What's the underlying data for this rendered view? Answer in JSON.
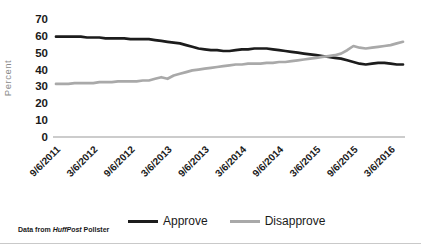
{
  "chart_data": {
    "type": "line",
    "title": "",
    "ylabel": "Percent",
    "ylim": [
      0,
      70
    ],
    "ytick_step": 10,
    "ytick_labels": [
      "0",
      "10",
      "20",
      "30",
      "40",
      "50",
      "60",
      "70"
    ],
    "x_start": "9/6/2011",
    "x_end": "5/6/2016",
    "x_interval": "monthly",
    "x_tick_labels": [
      "9/6/2011",
      "3/6/2012",
      "9/6/2012",
      "3/6/2013",
      "9/6/2013",
      "3/6/2014",
      "9/6/2014",
      "3/6/2015",
      "9/6/2015",
      "3/6/2016"
    ],
    "x_tick_indices": [
      0,
      6,
      12,
      18,
      24,
      30,
      36,
      42,
      48,
      54
    ],
    "grid": false,
    "legend_position": "bottom",
    "series": [
      {
        "name": "Approve",
        "color": "#1c1c1c",
        "values": [
          59.5,
          59.5,
          59.5,
          59.5,
          59.5,
          59,
          59,
          59,
          58.5,
          58.5,
          58.5,
          58.5,
          58,
          58,
          58,
          58,
          57.5,
          57,
          56.5,
          56,
          55.5,
          54.5,
          53.5,
          52.5,
          52,
          51.5,
          51.5,
          51,
          51,
          51.5,
          52,
          52,
          52.5,
          52.5,
          52.5,
          52,
          51.5,
          51,
          50.5,
          50,
          49.5,
          49,
          48.5,
          48,
          47.5,
          47,
          46.5,
          45.5,
          44.5,
          43.5,
          43,
          43.5,
          44,
          44,
          43.5,
          43,
          43
        ]
      },
      {
        "name": "Disapprove",
        "color": "#a9a9a9",
        "values": [
          31.5,
          31.5,
          31.5,
          32,
          32,
          32,
          32,
          32.5,
          32.5,
          32.5,
          33,
          33,
          33,
          33,
          33.5,
          33.5,
          34.5,
          35.5,
          34.5,
          36.5,
          37.5,
          38.5,
          39.5,
          40,
          40.5,
          41,
          41.5,
          42,
          42.5,
          43,
          43,
          43.5,
          43.5,
          43.5,
          44,
          44,
          44.5,
          44.5,
          45,
          45.5,
          46,
          46.5,
          47,
          47.5,
          48,
          48.5,
          49.5,
          51.5,
          54,
          53,
          52.5,
          53,
          53.5,
          54,
          54.5,
          55.5,
          56.5
        ]
      }
    ],
    "axis_color": "#9a9a9a",
    "tick_text_color": "#1a1a1a",
    "ylabel_color": "#8a8a8a"
  },
  "legend": {
    "approve_label": "Approve",
    "disapprove_label": "Disapprove"
  },
  "footnote": {
    "prefix": "Data from ",
    "source": "HuffPost",
    "suffix": " Pollster"
  }
}
